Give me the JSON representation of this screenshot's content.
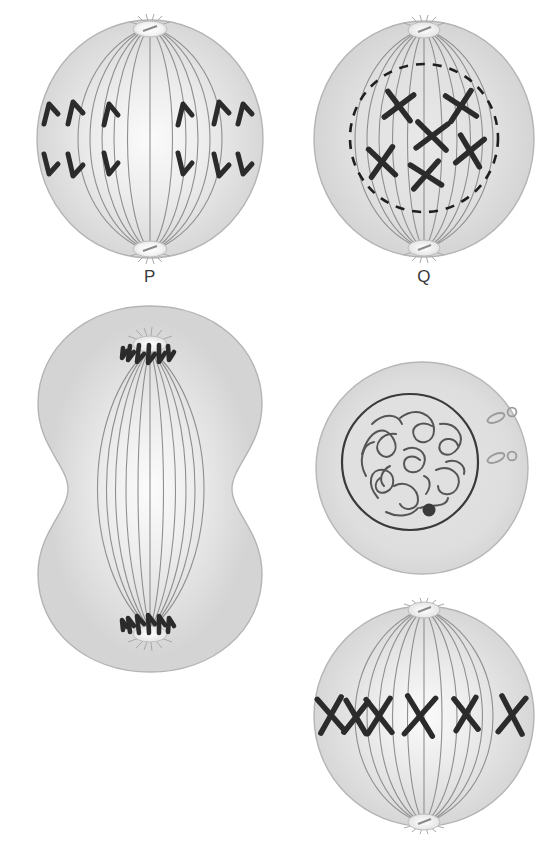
{
  "figure": {
    "background_color": "#ffffff",
    "cytoplasm_color": "#d9d9d9",
    "cytoplasm_edge_color": "#b4b4b4",
    "spindle_fiber_color": "#8c8c8c",
    "chromosome_color": "#2b2b2b",
    "nuclear_envelope_color": "#1f1f1f",
    "label_color": "#3b3b3b",
    "centrosome_color": "#f2f2f2"
  },
  "cells": [
    {
      "id": "P",
      "label": "P",
      "stage": "anaphase",
      "description": "Sister chromatids separated and moving toward opposite poles",
      "shape": "round",
      "nuclear_envelope": "absent",
      "spindle_fibers": 11,
      "chromatid_count": 12,
      "chromatids_upper": 6,
      "chromatids_lower": 6,
      "chromatid_shape": "v-shaped",
      "poles": 2,
      "centrioles_visible": true
    },
    {
      "id": "Q",
      "label": "Q",
      "stage": "prophase",
      "description": "Condensed X-shaped chromosomes inside a breaking-down dashed nuclear envelope",
      "shape": "round",
      "nuclear_envelope": "dashed-breaking-down",
      "spindle_fibers": 11,
      "chromosome_count": 6,
      "chromosome_shape": "x-shaped",
      "poles": 2,
      "centrioles_visible": true
    },
    {
      "id": "R",
      "label": "R",
      "stage": "telophase-cytokinesis",
      "description": "Cleavage furrow pinching the cell in two, chromatids clustered at both poles",
      "shape": "dumbbell-cleavage-furrow",
      "nuclear_envelope": "absent",
      "spindle_fibers": 11,
      "chromatid_clusters": 2,
      "chromatids_per_cluster": 6,
      "poles": 2,
      "centrioles_visible": true
    },
    {
      "id": "S",
      "label": "S",
      "stage": "interphase",
      "description": "Intact nucleus with uncondensed chromatin threads, nucleolus and two centriole pairs",
      "shape": "round",
      "nuclear_envelope": "solid-intact",
      "spindle_fibers": 0,
      "nucleolus": 1,
      "centriole_pairs": 2,
      "chromatin": "diffuse-threads"
    },
    {
      "id": "T",
      "label": "T",
      "stage": "metaphase",
      "description": "Six X-shaped chromosomes lined up on the equatorial metaphase plate",
      "shape": "round",
      "nuclear_envelope": "absent",
      "spindle_fibers": 11,
      "chromosome_count": 6,
      "chromosome_shape": "x-shaped",
      "alignment": "equatorial-plate",
      "poles": 2,
      "centrioles_visible": true
    }
  ]
}
